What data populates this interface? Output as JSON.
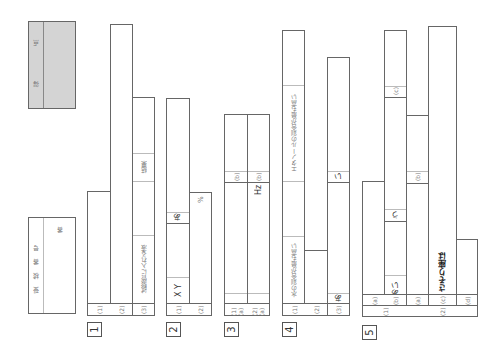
{
  "score_box": {
    "label_a": "得",
    "label_b": "点"
  },
  "exam_number": {
    "label": "受 検 番 号",
    "suffix": "番"
  },
  "sections": {
    "s1": {
      "number": "1",
      "q1": "(1)",
      "q2": "(2)",
      "q3": "(3)",
      "q3_label_a": "試験管に入れる液",
      "q3_label_b": "結果"
    },
    "s2": {
      "number": "2",
      "q1": "(1)",
      "q2": "(2)",
      "q1_label_a": "X Y",
      "q1_label_b": "あ",
      "q2_unit": "%"
    },
    "s3": {
      "number": "3",
      "q1a": "(1)(a)",
      "q1b": "(b)",
      "q2a": "(2)(a)",
      "q2b": "(b)",
      "q2_unit": "Hz"
    },
    "s4": {
      "number": "4",
      "q1": "(1)",
      "q2": "(2)",
      "q3": "(3)",
      "q1_label_a": "水の割合が最も高い",
      "q1_label_b": "エタノールの割合が最も高い",
      "q3_label_a": "あ",
      "q3_label_b": "い"
    },
    "s5": {
      "number": "5",
      "g1": "(1)",
      "g2": "(2)",
      "q1a": "(a)",
      "q1b": "(b)",
      "q1b_label_a": "あい",
      "q1b_label_b": "う",
      "q1c": "(c)",
      "q2a": "(a)",
      "q2b": "(b)",
      "q2c": "(c)",
      "q2c_prefix": "さそり座は",
      "q2d": "(d)"
    }
  }
}
